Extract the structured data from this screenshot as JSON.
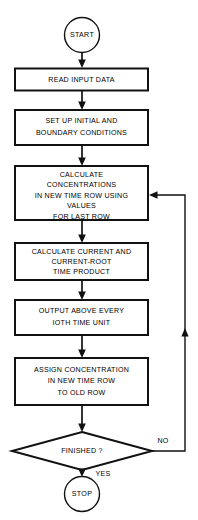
{
  "diagram": {
    "type": "flowchart",
    "colors": {
      "background": "#ffffff",
      "stroke": "#111111",
      "text": "#000000"
    },
    "nodes": {
      "start": {
        "kind": "terminator",
        "label": "START"
      },
      "read_input": {
        "kind": "process",
        "lines": [
          "READ INPUT DATA"
        ]
      },
      "set_up": {
        "kind": "process",
        "lines": [
          "SET UP INITIAL AND",
          "BOUNDARY CONDITIONS"
        ]
      },
      "calculate_concentrations": {
        "kind": "process",
        "lines": [
          "CALCULATE",
          "CONCENTRATIONS",
          "IN NEW TIME ROW USING",
          "VALUES",
          "FOR LAST ROW"
        ]
      },
      "calculate_current": {
        "kind": "process",
        "lines": [
          "CALCULATE CURRENT AND",
          "CURRENT-ROOT",
          "TIME PRODUCT"
        ]
      },
      "output": {
        "kind": "process",
        "lines": [
          "OUTPUT ABOVE EVERY",
          "IOTH TIME UNIT"
        ]
      },
      "assign": {
        "kind": "process",
        "lines": [
          "ASSIGN CONCENTRATION",
          "IN NEW TIME ROW",
          "TO OLD ROW"
        ]
      },
      "finished": {
        "kind": "decision",
        "label": "FINISHED ?"
      },
      "stop": {
        "kind": "terminator",
        "label": "STOP"
      }
    },
    "edge_labels": {
      "no": "NO",
      "yes": "YES"
    },
    "flow_order": [
      "start",
      "read_input",
      "set_up",
      "calculate_concentrations",
      "calculate_current",
      "output",
      "assign",
      "finished",
      "stop"
    ]
  }
}
